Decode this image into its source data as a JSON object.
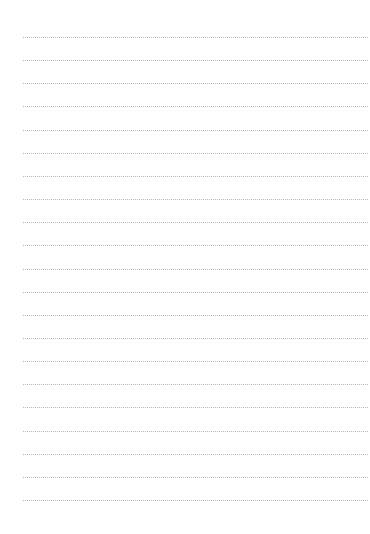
{
  "page": {
    "type": "blank-lined-sheet",
    "line_count": 21,
    "first_line_y": 37,
    "line_spacing": 23.15,
    "line_color": "#b9b9b9",
    "background": "#ffffff"
  }
}
